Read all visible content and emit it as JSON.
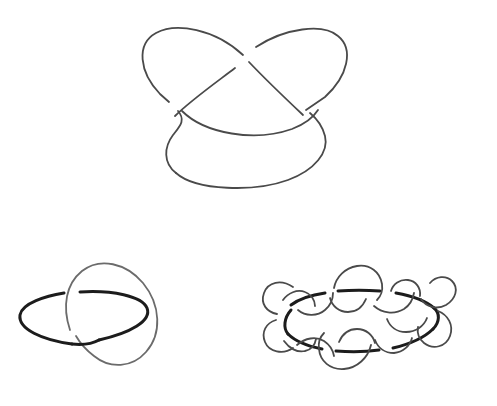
{
  "document": {
    "title": "Knot and Link Diagrams",
    "background_color": "#ffffff",
    "width": 497,
    "height": 406,
    "visible_text": []
  },
  "style": {
    "stroke_color_primary": "#4a4a4a",
    "stroke_color_dark": "#1c1c1c",
    "stroke_color_light": "#6b6b6b",
    "stroke_width_thin": 1.8,
    "stroke_width_thick": 3.0,
    "fill": "none"
  },
  "figures": [
    {
      "id": "figure-top-trefoil",
      "name": "trefoil-knot-diagram",
      "position": "top-center",
      "crossing_number": 3,
      "components": 1,
      "bounds": {
        "x": 138,
        "y": 22,
        "width": 208,
        "height": 168
      },
      "stroke_color": "#4a4a4a",
      "stroke_width": 1.8,
      "description": "Single closed curve forming a trefoil knot with three over-under crossings",
      "crossings": [
        {
          "id": "crossing-top-center",
          "x": 246,
          "y": 56
        },
        {
          "id": "crossing-lower-left",
          "x": 174,
          "y": 106
        },
        {
          "id": "crossing-lower-right",
          "x": 300,
          "y": 110
        }
      ]
    },
    {
      "id": "figure-bottom-left-hopf",
      "name": "hopf-link-diagram",
      "position": "bottom-left",
      "crossing_number": 2,
      "components": 2,
      "bounds": {
        "x": 18,
        "y": 263,
        "width": 155,
        "height": 113
      },
      "description": "Two interlocking loops: a flat horizontal ellipse drawn heavier and a tilted oval drawn lighter",
      "loops": [
        {
          "id": "loop-flat-ellipse",
          "name": "flat-horizontal-ellipse",
          "stroke_color": "#1c1c1c",
          "stroke_width": 3.0,
          "center": {
            "x": 83,
            "y": 317
          },
          "radii": {
            "rx": 63,
            "ry": 24
          },
          "rotation_deg": -2
        },
        {
          "id": "loop-tilted-oval",
          "name": "tilted-oval",
          "stroke_color": "#6b6b6b",
          "stroke_width": 1.8,
          "center": {
            "x": 110,
            "y": 319
          },
          "radii": {
            "rx": 37,
            "ry": 58
          },
          "rotation_deg": 28
        }
      ],
      "crossings": [
        {
          "id": "crossing-upper-left",
          "x": 71,
          "y": 296,
          "over": "loop-tilted-oval"
        },
        {
          "id": "crossing-lower",
          "x": 74,
          "y": 336,
          "over": "loop-flat-ellipse"
        }
      ]
    },
    {
      "id": "figure-bottom-right-wavy",
      "name": "wavy-curve-around-ellipse-link",
      "position": "bottom-right",
      "crossing_number": 12,
      "components": 2,
      "bounds": {
        "x": 262,
        "y": 262,
        "width": 200,
        "height": 120
      },
      "description": "A meandering sinusoidal loop weaving alternately over and under a flat horizontal ellipse",
      "loops": [
        {
          "id": "loop-flat-ellipse-right",
          "name": "flat-horizontal-ellipse",
          "stroke_color": "#1c1c1c",
          "stroke_width": 3.0,
          "center": {
            "x": 361,
            "y": 321
          },
          "radii": {
            "rx": 78,
            "ry": 31
          },
          "rotation_deg": 0
        },
        {
          "id": "loop-wavy",
          "name": "wavy-meander-loop",
          "stroke_color": "#4a4a4a",
          "stroke_width": 1.8,
          "lobes": 6,
          "description": "Closed wavy curve with six outward lobes alternating above and below the ellipse plane"
        }
      ]
    }
  ],
  "chart_data": {
    "type": "diagram",
    "items": [
      {
        "label": "trefoil knot",
        "crossings": 3,
        "components": 1
      },
      {
        "label": "Hopf link",
        "crossings": 2,
        "components": 2
      },
      {
        "label": "wavy loop around ellipse",
        "crossings": 12,
        "components": 2
      }
    ]
  }
}
